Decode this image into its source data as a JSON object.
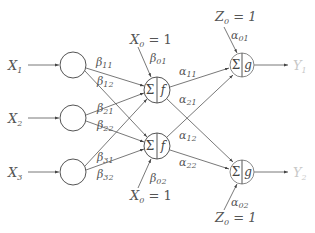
{
  "diagram": {
    "type": "neural-network",
    "colors": {
      "stroke": "#555555",
      "output_label": "#c8c8c8",
      "background": "#ffffff"
    },
    "inputs": [
      {
        "label": "X",
        "sub": "1"
      },
      {
        "label": "X",
        "sub": "2"
      },
      {
        "label": "X",
        "sub": "3"
      }
    ],
    "hidden": [
      {
        "sum": "Σ",
        "act": "f"
      },
      {
        "sum": "Σ",
        "act": "f"
      }
    ],
    "outputs_nodes": [
      {
        "sum": "Σ",
        "act": "g"
      },
      {
        "sum": "Σ",
        "act": "g"
      }
    ],
    "outputs": [
      {
        "label": "Y",
        "sub": "1"
      },
      {
        "label": "Y",
        "sub": "2"
      }
    ],
    "biases": {
      "hidden_top": {
        "text": "X",
        "sub": "0",
        "rest": " = 1",
        "weight": "β",
        "weight_sub": "01"
      },
      "hidden_bottom": {
        "text": "X",
        "sub": "0",
        "rest": " = 1",
        "weight": "β",
        "weight_sub": "02"
      },
      "output_top": {
        "text": "Z",
        "sub": "0",
        "rest": " = 1",
        "weight": "α",
        "weight_sub": "01"
      },
      "output_bottom": {
        "text": "Z",
        "sub": "0",
        "rest": " = 1",
        "weight": "α",
        "weight_sub": "02"
      }
    },
    "weights": {
      "b11": {
        "sym": "β",
        "sub": "11"
      },
      "b12": {
        "sym": "β",
        "sub": "12"
      },
      "b21": {
        "sym": "β",
        "sub": "21"
      },
      "b22": {
        "sym": "β",
        "sub": "22"
      },
      "b31": {
        "sym": "β",
        "sub": "31"
      },
      "b32": {
        "sym": "β",
        "sub": "32"
      },
      "a11": {
        "sym": "α",
        "sub": "11"
      },
      "a21": {
        "sym": "α",
        "sub": "21"
      },
      "a12": {
        "sym": "α",
        "sub": "12"
      },
      "a22": {
        "sym": "α",
        "sub": "22"
      }
    }
  }
}
